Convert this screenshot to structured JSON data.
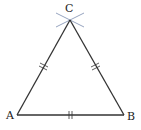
{
  "diagram": {
    "type": "geometric-construction",
    "vertices": {
      "A": {
        "label": "A",
        "x": 17,
        "y": 115
      },
      "B": {
        "label": "B",
        "x": 124,
        "y": 115
      },
      "C": {
        "label": "C",
        "x": 70,
        "y": 20
      }
    },
    "sides": [
      {
        "from": "A",
        "to": "B",
        "tick_marks": 2
      },
      {
        "from": "A",
        "to": "C",
        "tick_marks": 2
      },
      {
        "from": "B",
        "to": "C",
        "tick_marks": 2
      }
    ],
    "colors": {
      "line": "#333333",
      "arc": "#8a9ab8",
      "label": "#222222"
    }
  }
}
